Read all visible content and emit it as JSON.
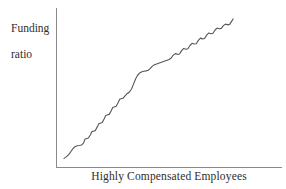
{
  "chart_data": {
    "type": "line",
    "title": "",
    "subtitle": "",
    "xlabel": "Highly Compensated Employees",
    "ylabel_line1": "Funding",
    "ylabel_line2": "ratio",
    "ylabel": "Funding ratio",
    "grid": false,
    "legend": "none",
    "axis_ticks": "none",
    "axis_color": "#8a8a8a",
    "line_color": "#555555",
    "background_color": "#ffffff",
    "text_color": "#2e2e2e",
    "xlim": [
      0,
      100
    ],
    "ylim": [
      0,
      100
    ],
    "series": [
      {
        "name": "Funding ratio",
        "x": [
          2.3,
          3.6,
          5.0,
          6.2,
          7.4,
          8.6,
          9.9,
          11.2,
          12.4,
          13.6,
          14.3,
          15.5,
          16.3,
          17.5,
          18.3,
          19.5,
          20.3,
          21.5,
          22.3,
          23.5,
          24.3,
          25.5,
          26.3,
          27.5,
          28.3,
          29.5,
          30.3,
          31.5,
          32.3,
          33.5,
          34.3,
          35.5,
          36.3,
          37.5,
          38.7,
          39.9,
          41.1,
          42.3,
          43.5,
          44.7,
          45.9,
          47.1,
          48.3,
          49.5,
          50.7,
          51.9,
          53.1,
          54.3,
          55.5,
          56.7,
          57.9,
          59.1,
          60.3,
          61.5,
          62.7,
          63.9,
          65.1,
          66.3,
          67.5,
          68.7,
          69.9,
          71.1,
          72.3,
          73.5,
          74.7,
          75.9,
          77.1,
          78.3,
          79.5,
          80.7,
          81.9,
          83.1,
          84.3,
          85.5,
          86.7,
          87.9,
          89.1,
          90.3,
          91.5,
          92.7,
          93.9,
          95.1,
          96.3,
          97.5,
          98.7,
          99.5
        ],
        "y": [
          3.5,
          4.5,
          6.0,
          8.0,
          10.0,
          11.4,
          12.0,
          12.2,
          12.5,
          14.0,
          16.5,
          17.0,
          17.3,
          19.5,
          21.5,
          22.0,
          22.3,
          25.0,
          27.0,
          27.5,
          27.8,
          30.5,
          32.5,
          33.0,
          33.3,
          36.0,
          38.0,
          38.5,
          38.8,
          41.5,
          43.5,
          44.0,
          44.3,
          46.0,
          47.5,
          48.5,
          50.5,
          54.0,
          57.5,
          60.0,
          61.5,
          62.2,
          62.5,
          62.8,
          63.2,
          64.5,
          66.0,
          67.0,
          67.5,
          68.0,
          68.5,
          69.0,
          69.5,
          70.0,
          70.5,
          71.5,
          73.5,
          74.5,
          74.0,
          74.2,
          76.5,
          78.0,
          77.5,
          77.8,
          80.0,
          81.5,
          81.0,
          81.2,
          83.5,
          85.0,
          84.5,
          84.8,
          87.0,
          88.5,
          88.0,
          88.3,
          90.5,
          91.8,
          91.3,
          91.6,
          93.5,
          94.5,
          94.0,
          94.3,
          96.5,
          98.0
        ]
      }
    ]
  }
}
